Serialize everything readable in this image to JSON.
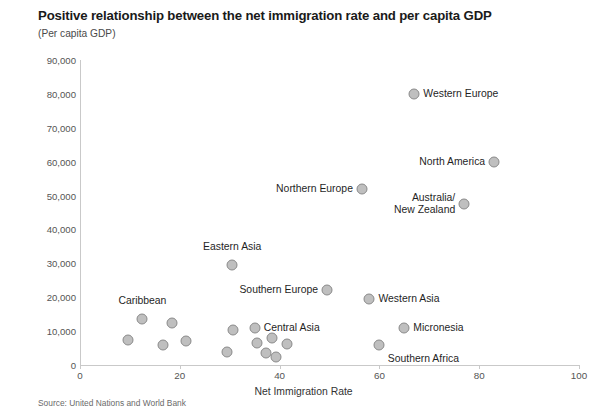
{
  "chart_data": {
    "type": "scatter",
    "title": "Positive relationship between the net immigration rate and per capita GDP",
    "subtitle": "(Per capita GDP)",
    "source": "Source: United Nations and World Bank",
    "xlabel": "Net Immigration Rate",
    "ylabel": "",
    "xlim": [
      0,
      100
    ],
    "ylim": [
      0,
      90000
    ],
    "grid": false,
    "legend": "none",
    "xticks": [
      "0",
      "20",
      "40",
      "60",
      "80",
      "100"
    ],
    "xtick_values": [
      0,
      20,
      40,
      60,
      80,
      100
    ],
    "yticks": [
      "0",
      "10,000",
      "20,000",
      "30,000",
      "40,000",
      "50,000",
      "60,000",
      "70,000",
      "80,000",
      "90,000"
    ],
    "ytick_values": [
      0,
      10000,
      20000,
      30000,
      40000,
      50000,
      60000,
      70000,
      80000,
      90000
    ],
    "points": [
      {
        "label": "Western Europe",
        "x": 67.0,
        "y": 80000,
        "label_pos": "right"
      },
      {
        "label": "North America",
        "x": 83.0,
        "y": 60000,
        "label_pos": "left"
      },
      {
        "label": "Northern Europe",
        "x": 56.5,
        "y": 52000,
        "label_pos": "left"
      },
      {
        "label": "Australia/\nNew Zealand",
        "x": 77.0,
        "y": 47500,
        "label_pos": "left"
      },
      {
        "label": "Eastern Asia",
        "x": 30.5,
        "y": 29500,
        "label_pos": "above"
      },
      {
        "label": "Southern Europe",
        "x": 49.5,
        "y": 22000,
        "label_pos": "left"
      },
      {
        "label": "Western Asia",
        "x": 58.0,
        "y": 19500,
        "label_pos": "right"
      },
      {
        "label": "Micronesia",
        "x": 65.0,
        "y": 11000,
        "label_pos": "right"
      },
      {
        "label": "Central Asia",
        "x": 35.0,
        "y": 11000,
        "label_pos": "right"
      },
      {
        "label": "Caribbean",
        "x": 12.5,
        "y": 13500,
        "label_pos": "above"
      },
      {
        "label": "Southern Africa",
        "x": 60.0,
        "y": 6000,
        "label_pos": "below"
      },
      {
        "label": "",
        "x": 17.5,
        "y": 11000,
        "x_px": 172,
        "y_px": 323
      },
      {
        "label": "",
        "x": 9.0,
        "y": 6000,
        "x_px": 128,
        "y_px": 340
      },
      {
        "label": "",
        "x": 16.0,
        "y": 4800,
        "x_px": 163,
        "y_px": 345
      },
      {
        "label": "",
        "x": 20.5,
        "y": 5500,
        "x_px": 186,
        "y_px": 341
      },
      {
        "label": "",
        "x": 29.5,
        "y": 9000,
        "x_px": 233,
        "y_px": 330
      },
      {
        "label": "",
        "x": 28.0,
        "y": 2800,
        "x_px": 227,
        "y_px": 352
      },
      {
        "label": "",
        "x": 38.0,
        "y": 5200,
        "x_px": 257,
        "y_px": 343
      },
      {
        "label": "",
        "x": 41.5,
        "y": 6200,
        "x_px": 272,
        "y_px": 338
      },
      {
        "label": "",
        "x": 45.0,
        "y": 5000,
        "x_px": 287,
        "y_px": 344
      },
      {
        "label": "",
        "x": 40.0,
        "y": 2600,
        "x_px": 266,
        "y_px": 353
      },
      {
        "label": "",
        "x": 42.5,
        "y": 1800,
        "x_px": 276,
        "y_px": 357
      }
    ]
  }
}
